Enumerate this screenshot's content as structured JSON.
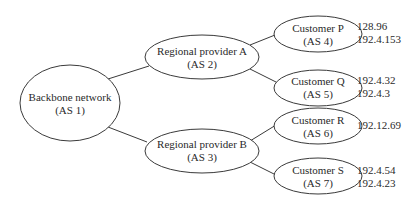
{
  "diagram": {
    "type": "hierarchical network tree",
    "colors": {
      "stroke": "#3a3a3a",
      "text": "#2a2a2a",
      "background": "#ffffff"
    },
    "nodes": {
      "backbone": {
        "name": "Backbone network",
        "as": "(AS 1)"
      },
      "regional_a": {
        "name": "Regional provider A",
        "as": "(AS 2)"
      },
      "regional_b": {
        "name": "Regional provider B",
        "as": "(AS 3)"
      },
      "customer_p": {
        "name": "Customer P",
        "as": "(AS 4)",
        "prefixes": [
          "128.96",
          "192.4.153"
        ]
      },
      "customer_q": {
        "name": "Customer Q",
        "as": "(AS 5)",
        "prefixes": [
          "192.4.32",
          "192.4.3"
        ]
      },
      "customer_r": {
        "name": "Customer R",
        "as": "(AS 6)",
        "prefixes": [
          "192.12.69"
        ]
      },
      "customer_s": {
        "name": "Customer S",
        "as": "(AS 7)",
        "prefixes": [
          "192.4.54",
          "192.4.23"
        ]
      }
    },
    "edges": [
      [
        "backbone",
        "regional_a"
      ],
      [
        "backbone",
        "regional_b"
      ],
      [
        "regional_a",
        "customer_p"
      ],
      [
        "regional_a",
        "customer_q"
      ],
      [
        "regional_b",
        "customer_r"
      ],
      [
        "regional_b",
        "customer_s"
      ]
    ]
  }
}
